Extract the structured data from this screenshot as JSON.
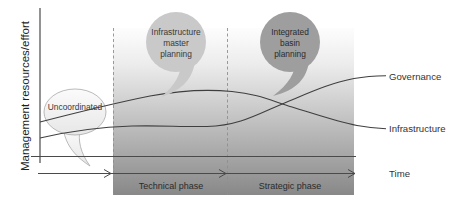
{
  "y_axis": {
    "label": "Management resources/effort"
  },
  "x_axis": {
    "label": "Time"
  },
  "phases": {
    "technical": "Technical phase",
    "strategic": "Strategic phase"
  },
  "bubbles": {
    "uncoordinated": {
      "line1": "Uncoordinated"
    },
    "infrastructure_master": {
      "line1": "Infrastructure",
      "line2": "master",
      "line3": "planning"
    },
    "integrated_basin": {
      "line1": "Integrated",
      "line2": "basin",
      "line3": "planning"
    }
  },
  "curve_labels": {
    "governance": "Governance",
    "infrastructure": "Infrastructure"
  },
  "colors": {
    "bubble_light": "#f4f4f4",
    "bubble_medium": "#c9c9c9",
    "bubble_dark": "#9e9e9e",
    "region_gradient_top": "#fdfdfd",
    "region_gradient_bottom": "#888888",
    "curve_stroke": "#3f3f3f"
  }
}
